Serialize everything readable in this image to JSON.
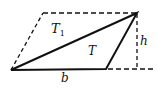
{
  "diagram": {
    "type": "geometry",
    "labels": {
      "t1": "T",
      "t1_sub": "1",
      "t": "T",
      "h": "h",
      "b": "b"
    },
    "vertices": {
      "A": [
        11,
        70
      ],
      "B": [
        106,
        69
      ],
      "C": [
        137,
        13
      ],
      "D": [
        43,
        13
      ]
    },
    "colors": {
      "stroke": "#111111",
      "background": "#ffffff"
    }
  }
}
